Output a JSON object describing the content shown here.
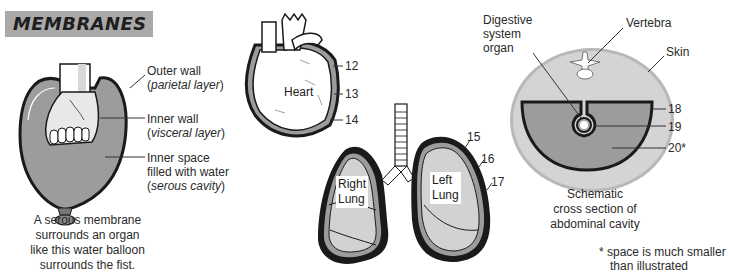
{
  "title": "MEMBRANES",
  "balloon": {
    "labels": {
      "outer_wall": "Outer wall",
      "outer_wall_term": "parietal layer",
      "inner_wall": "Inner wall",
      "inner_wall_term": "visceral layer",
      "inner_space_1": "Inner space",
      "inner_space_2": "filled with water",
      "inner_space_term": "serous cavity"
    },
    "caption": [
      "A serous membrane",
      "surrounds an organ",
      "like this water balloon",
      "surrounds the fist."
    ]
  },
  "heart": {
    "label": "Heart",
    "numbers": [
      "12",
      "13",
      "14"
    ]
  },
  "lungs": {
    "right_label_1": "Right",
    "right_label_2": "Lung",
    "left_label_1": "Left",
    "left_label_2": "Lung",
    "numbers": [
      "15",
      "16",
      "17"
    ]
  },
  "cross_section": {
    "labels": {
      "digestive_1": "Digestive",
      "digestive_2": "system",
      "digestive_3": "organ",
      "vertebra": "Vertebra",
      "skin": "Skin"
    },
    "numbers": [
      "18",
      "19",
      "20*"
    ],
    "caption": [
      "Schematic",
      "cross section of",
      "abdominal cavity"
    ]
  },
  "footnote": [
    "* space is much smaller",
    "than illustrated"
  ],
  "colors": {
    "banner": "#a9a9a9",
    "fill_gray": "#9c9c9c",
    "light_gray": "#c9c9c9",
    "outline": "#1a1a1a"
  }
}
